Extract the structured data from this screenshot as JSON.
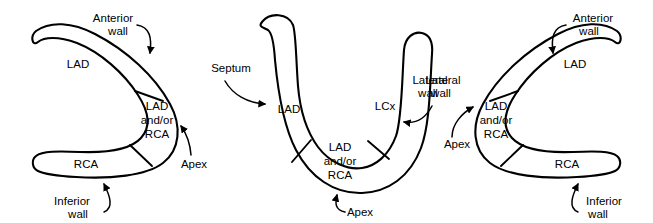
{
  "figure": {
    "stroke_color": "#000000",
    "fill_color": "#ffffff",
    "background": "#ffffff",
    "panel_count": 3
  },
  "panels": [
    {
      "id": "panel-left",
      "name": "horizontal-long-axis-view",
      "orientation": "C-shape opening left",
      "regions": [
        {
          "name": "lad-region",
          "label": "LAD"
        },
        {
          "name": "apex-region",
          "label_lines": [
            "LAD",
            "and/or",
            "RCA"
          ]
        },
        {
          "name": "rca-region",
          "label": "RCA"
        }
      ],
      "annotations": [
        {
          "name": "anterior-wall-label",
          "lines": [
            "Anterior",
            "wall"
          ]
        },
        {
          "name": "inferior-wall-label",
          "lines": [
            "Inferior",
            "wall"
          ]
        },
        {
          "name": "apex-label",
          "lines": [
            "Apex"
          ]
        }
      ]
    },
    {
      "id": "panel-middle",
      "name": "short-axis-u-view",
      "orientation": "U-shape opening up",
      "regions": [
        {
          "name": "lad-region",
          "label": "LAD"
        },
        {
          "name": "apex-region",
          "label_lines": [
            "LAD",
            "and/or",
            "RCA"
          ]
        },
        {
          "name": "lcx-region",
          "label": "LCx"
        }
      ],
      "annotations": [
        {
          "name": "septum-label",
          "lines": [
            "Septum"
          ]
        },
        {
          "name": "lateral-wall-label",
          "lines": [
            "Lateral",
            "wall"
          ]
        },
        {
          "name": "apex-label",
          "lines": [
            "Apex"
          ]
        }
      ]
    },
    {
      "id": "panel-right",
      "name": "horizontal-long-axis-view-mirrored",
      "orientation": "C-shape opening right",
      "regions": [
        {
          "name": "lad-region",
          "label": "LAD"
        },
        {
          "name": "apex-region",
          "label_lines": [
            "LAD",
            "and/or",
            "RCA"
          ]
        },
        {
          "name": "rca-region",
          "label": "RCA"
        }
      ],
      "annotations": [
        {
          "name": "anterior-wall-label",
          "lines": [
            "Anterior",
            "wall"
          ]
        },
        {
          "name": "inferior-wall-label",
          "lines": [
            "Inferior",
            "wall"
          ]
        },
        {
          "name": "lateral-wall-label",
          "lines": [
            "Lateral",
            "wall"
          ]
        },
        {
          "name": "apex-label",
          "lines": [
            "Apex"
          ]
        }
      ]
    }
  ],
  "text": {
    "lad": "LAD",
    "rca": "RCA",
    "lcx": "LCx",
    "andor": "and/or",
    "apex": "Apex",
    "septum": "Septum",
    "anterior": "Anterior",
    "lateral": "Lateral",
    "inferior": "Inferior",
    "wall": "wall"
  }
}
